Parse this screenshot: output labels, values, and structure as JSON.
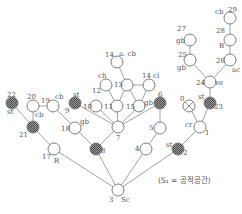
{
  "caption": "(S₁ = 공적공간)",
  "colors": {
    "line": "#8a8a8a",
    "node_stroke": "#707070",
    "hatched_fill": "#6e6e6e",
    "open_fill": "#ffffff"
  },
  "nodes": [
    {
      "id": "3",
      "x": 118,
      "y": 190,
      "type": "open",
      "num_label": "3",
      "num_dx": -9,
      "num_dy": 12,
      "tag": "Sc",
      "tag_dx": 3,
      "tag_dy": 12
    },
    {
      "id": "17",
      "x": 54,
      "y": 149,
      "type": "open",
      "num_label": "17",
      "num_dx": -12,
      "num_dy": 10,
      "tag": "B",
      "tag_dx": 0,
      "tag_dy": 14
    },
    {
      "id": "21",
      "x": 33,
      "y": 127,
      "type": "hatched",
      "num_label": "21",
      "num_dx": -14,
      "num_dy": 10,
      "tag": "",
      "tag_dx": 0,
      "tag_dy": 0
    },
    {
      "id": "22",
      "x": 12,
      "y": 103,
      "type": "hatched",
      "num_label": "22",
      "num_dx": -5,
      "num_dy": -6,
      "tag": "st",
      "tag_dx": -5,
      "tag_dy": 11
    },
    {
      "id": "20",
      "x": 33,
      "y": 106,
      "type": "open",
      "num_label": "20",
      "num_dx": -6,
      "num_dy": -7,
      "tag": "cb",
      "tag_dx": 2,
      "tag_dy": 11
    },
    {
      "id": "19",
      "x": 53,
      "y": 106,
      "type": "open",
      "num_label": "19",
      "num_dx": -12,
      "num_dy": -3,
      "tag": "cb",
      "tag_dx": 2,
      "tag_dy": -7
    },
    {
      "id": "18",
      "x": 75,
      "y": 128,
      "type": "open",
      "num_label": "18",
      "num_dx": -14,
      "num_dy": 3,
      "tag": "gb",
      "tag_dx": 5,
      "tag_dy": -4
    },
    {
      "id": "9",
      "x": 75,
      "y": 103,
      "type": "hatched",
      "num_label": "9",
      "num_dx": -10,
      "num_dy": 10,
      "tag": "st",
      "tag_dx": -2,
      "tag_dy": -6
    },
    {
      "id": "8",
      "x": 96,
      "y": 149,
      "type": "hatched",
      "num_label": "8",
      "num_dx": 5,
      "num_dy": 4,
      "tag": "",
      "tag_dx": 0,
      "tag_dy": 0
    },
    {
      "id": "7",
      "x": 118,
      "y": 127,
      "type": "open",
      "num_label": "7",
      "num_dx": -2,
      "num_dy": 13,
      "tag": "",
      "tag_dx": 0,
      "tag_dy": 0
    },
    {
      "id": "10",
      "x": 96,
      "y": 106,
      "type": "open",
      "num_label": "10",
      "num_dx": -13,
      "num_dy": 3,
      "tag": "",
      "tag_dx": 0,
      "tag_dy": 0
    },
    {
      "id": "11",
      "x": 117,
      "y": 106,
      "type": "open",
      "num_label": "11",
      "num_dx": -13,
      "num_dy": 3,
      "tag": "",
      "tag_dx": 0,
      "tag_dy": 0
    },
    {
      "id": "12",
      "x": 106,
      "y": 85,
      "type": "open",
      "num_label": "12",
      "num_dx": -14,
      "num_dy": 8,
      "tag": "ch",
      "tag_dx": -8,
      "tag_dy": -7
    },
    {
      "id": "13",
      "x": 127,
      "y": 85,
      "type": "open",
      "num_label": "13",
      "num_dx": -13,
      "num_dy": 2,
      "tag": "",
      "tag_dx": 0,
      "tag_dy": 0
    },
    {
      "id": "14a",
      "x": 117,
      "y": 62,
      "type": "open",
      "num_label": "14",
      "num_dx": -12,
      "num_dy": -5,
      "tag": "a. cb",
      "tag_dx": 2,
      "tag_dy": -6
    },
    {
      "id": "14b",
      "x": 149,
      "y": 85,
      "type": "open",
      "num_label": "14",
      "num_dx": -7,
      "num_dy": -7,
      "tag": "cl",
      "tag_dx": 4,
      "tag_dy": -7
    },
    {
      "id": "15",
      "x": 139,
      "y": 106,
      "type": "open",
      "num_label": "15",
      "num_dx": -13,
      "num_dy": 3,
      "tag": "gb",
      "tag_dx": 5,
      "tag_dy": -1
    },
    {
      "id": "6",
      "x": 160,
      "y": 103,
      "type": "hatched",
      "num_label": "6",
      "num_dx": -2,
      "num_dy": -6,
      "tag": "",
      "tag_dx": 0,
      "tag_dy": 0
    },
    {
      "id": "5",
      "x": 160,
      "y": 128,
      "type": "open",
      "num_label": "5",
      "num_dx": -11,
      "num_dy": 2,
      "tag": "",
      "tag_dx": 0,
      "tag_dy": 0
    },
    {
      "id": "4",
      "x": 146,
      "y": 149,
      "type": "open",
      "num_label": "4",
      "num_dx": -11,
      "num_dy": 2,
      "tag": "",
      "tag_dx": 0,
      "tag_dy": 0
    },
    {
      "id": "2",
      "x": 178,
      "y": 149,
      "type": "hatched",
      "num_label": "2",
      "num_dx": 5,
      "num_dy": 6,
      "tag": "st",
      "tag_dx": -12,
      "tag_dy": -2
    },
    {
      "id": "1",
      "x": 200,
      "y": 127,
      "type": "open",
      "num_label": "1",
      "num_dx": 5,
      "num_dy": 8,
      "tag": "cr",
      "tag_dx": -15,
      "tag_dy": 0
    },
    {
      "id": "0",
      "x": 189,
      "y": 106,
      "type": "crossed",
      "num_label": "0",
      "num_dx": -9,
      "num_dy": -5,
      "tag": "",
      "tag_dx": 0,
      "tag_dy": 0
    },
    {
      "id": "23",
      "x": 210,
      "y": 103,
      "type": "hatched",
      "num_label": "23",
      "num_dx": 4,
      "num_dy": 6,
      "tag": "st",
      "tag_dx": -12,
      "tag_dy": -4
    },
    {
      "id": "24",
      "x": 210,
      "y": 82,
      "type": "open",
      "num_label": "24",
      "num_dx": -14,
      "num_dy": 3,
      "tag": "ve",
      "tag_dx": 5,
      "tag_dy": 3
    },
    {
      "id": "25",
      "x": 190,
      "y": 60,
      "type": "open",
      "num_label": "25",
      "num_dx": -12,
      "num_dy": -3,
      "tag": "gb",
      "tag_dx": -13,
      "tag_dy": 10
    },
    {
      "id": "27",
      "x": 190,
      "y": 40,
      "type": "open",
      "num_label": "27",
      "num_dx": -13,
      "num_dy": -9,
      "tag": "gb",
      "tag_dx": -14,
      "tag_dy": 3
    },
    {
      "id": "26",
      "x": 230,
      "y": 60,
      "type": "open",
      "num_label": "26",
      "num_dx": -14,
      "num_dy": 3,
      "tag": "ac",
      "tag_dx": 2,
      "tag_dy": 12
    },
    {
      "id": "28",
      "x": 230,
      "y": 40,
      "type": "open",
      "num_label": "28",
      "num_dx": -14,
      "num_dy": -7,
      "tag": "B",
      "tag_dx": -11,
      "tag_dy": 8
    },
    {
      "id": "29",
      "x": 230,
      "y": 18,
      "type": "open",
      "num_label": "29",
      "num_dx": -2,
      "num_dy": -6,
      "tag": "cb",
      "tag_dx": -15,
      "tag_dy": -4
    }
  ],
  "edges": [
    [
      "3",
      "17"
    ],
    [
      "17",
      "21"
    ],
    [
      "21",
      "22"
    ],
    [
      "21",
      "20"
    ],
    [
      "20",
      "19"
    ],
    [
      "19",
      "18"
    ],
    [
      "18",
      "8"
    ],
    [
      "3",
      "8"
    ],
    [
      "8",
      "7"
    ],
    [
      "7",
      "9"
    ],
    [
      "7",
      "10"
    ],
    [
      "7",
      "11"
    ],
    [
      "7",
      "15"
    ],
    [
      "7",
      "6"
    ],
    [
      "11",
      "12"
    ],
    [
      "11",
      "13"
    ],
    [
      "13",
      "14a"
    ],
    [
      "13",
      "15"
    ],
    [
      "15",
      "14b"
    ],
    [
      "13",
      "14b"
    ],
    [
      "6",
      "5"
    ],
    [
      "5",
      "4"
    ],
    [
      "4",
      "3"
    ],
    [
      "3",
      "2"
    ],
    [
      "2",
      "1"
    ],
    [
      "1",
      "0"
    ],
    [
      "1",
      "23"
    ],
    [
      "23",
      "24"
    ],
    [
      "24",
      "25"
    ],
    [
      "25",
      "27"
    ],
    [
      "24",
      "26"
    ],
    [
      "26",
      "28"
    ],
    [
      "28",
      "29"
    ]
  ]
}
